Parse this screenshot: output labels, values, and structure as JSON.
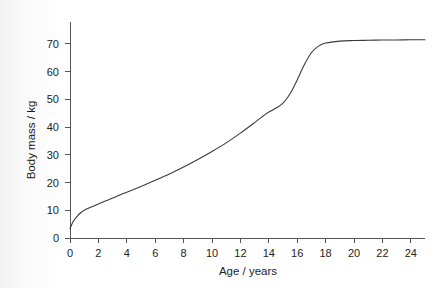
{
  "chart_data": {
    "type": "line",
    "title": "",
    "xlabel": "Age / years",
    "ylabel": "Body mass / kg",
    "xlim": [
      0,
      25
    ],
    "ylim": [
      0,
      75
    ],
    "xticks": [
      0,
      2,
      4,
      6,
      8,
      10,
      12,
      14,
      16,
      18,
      20,
      22,
      24
    ],
    "yticks": [
      0,
      10,
      20,
      30,
      40,
      50,
      60,
      70
    ],
    "grid": false,
    "legend": null,
    "series": [
      {
        "name": "Body mass",
        "color": "#3a3a3a",
        "x": [
          0,
          0.25,
          0.5,
          0.75,
          1,
          1.5,
          2,
          2.5,
          3,
          3.5,
          4,
          5,
          6,
          7,
          8,
          9,
          10,
          11,
          12,
          13,
          13.5,
          14,
          14.5,
          15,
          15.5,
          16,
          16.5,
          17,
          17.5,
          18,
          19,
          20,
          21,
          22,
          23,
          24,
          25
        ],
        "values": [
          3.4,
          6.2,
          7.8,
          9.1,
          10.0,
          11.2,
          12.3,
          13.3,
          14.4,
          15.5,
          16.5,
          18.6,
          20.8,
          23.1,
          25.6,
          28.3,
          31.2,
          34.3,
          37.8,
          41.6,
          43.6,
          45.4,
          46.8,
          48.6,
          52.0,
          57.0,
          62.5,
          66.8,
          69.2,
          70.3,
          71.0,
          71.2,
          71.3,
          71.4,
          71.4,
          71.5,
          71.5
        ]
      }
    ],
    "axis_color": "#555555",
    "line_width": 1.1
  },
  "axes": {
    "y_tick_labels": [
      "0",
      "10",
      "20",
      "30",
      "40",
      "50",
      "60",
      "70"
    ],
    "x_tick_labels": [
      "0",
      "2",
      "4",
      "6",
      "8",
      "10",
      "12",
      "14",
      "16",
      "18",
      "20",
      "22",
      "24"
    ],
    "x_title": "Age / years",
    "y_title": "Body mass / kg"
  }
}
